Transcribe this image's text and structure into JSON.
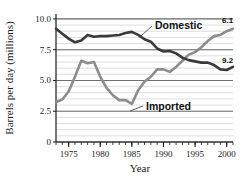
{
  "chart_data": {
    "type": "line",
    "title": "",
    "xlabel": "Year",
    "ylabel": "Barrels per day (millions)",
    "xlim": [
      1973,
      2001
    ],
    "ylim": [
      0,
      10.4
    ],
    "yticks": [
      "0",
      "2.5",
      "5.0",
      "7.5",
      "10.0"
    ],
    "ytick_values": [
      0,
      2.5,
      5.0,
      7.5,
      10.0
    ],
    "xticks": [
      "1975",
      "1980",
      "1985",
      "1990",
      "1995",
      "2000"
    ],
    "xtick_values": [
      1975,
      1980,
      1985,
      1990,
      1995,
      2000
    ],
    "grid": "horizontal-minor-and-major",
    "minor_y_step": 0.5,
    "minor_x_step": 1,
    "legend_position": "inline-annotations",
    "series": [
      {
        "name": "Domestic",
        "label": "Domestic",
        "color": "#3a3a3a",
        "end_value_label": "9.2",
        "x": [
          1973,
          1974,
          1975,
          1976,
          1977,
          1978,
          1979,
          1980,
          1981,
          1982,
          1983,
          1984,
          1985,
          1986,
          1987,
          1988,
          1989,
          1990,
          1991,
          1992,
          1993,
          1994,
          1995,
          1996,
          1997,
          1998,
          1999,
          2000,
          2001
        ],
        "values": [
          9.2,
          8.8,
          8.4,
          8.1,
          8.25,
          8.7,
          8.55,
          8.6,
          8.6,
          8.65,
          8.7,
          8.85,
          8.95,
          8.7,
          8.35,
          8.15,
          7.6,
          7.35,
          7.4,
          7.2,
          6.85,
          6.65,
          6.55,
          6.45,
          6.45,
          6.25,
          5.9,
          5.85,
          6.1
        ]
      },
      {
        "name": "Imported",
        "label": "Imported",
        "color": "#8c8c8c",
        "end_value_label": "6.1",
        "x": [
          1973,
          1974,
          1975,
          1976,
          1977,
          1978,
          1979,
          1980,
          1981,
          1982,
          1983,
          1984,
          1985,
          1986,
          1987,
          1988,
          1989,
          1990,
          1991,
          1992,
          1993,
          1994,
          1995,
          1996,
          1997,
          1998,
          1999,
          2000,
          2001
        ],
        "values": [
          3.25,
          3.45,
          4.1,
          5.3,
          6.6,
          6.4,
          6.5,
          5.3,
          4.4,
          3.8,
          3.4,
          3.4,
          3.1,
          4.2,
          4.9,
          5.3,
          5.9,
          5.9,
          5.7,
          6.1,
          6.6,
          7.1,
          7.3,
          7.7,
          8.2,
          8.6,
          8.7,
          9.0,
          9.2
        ]
      }
    ],
    "annotations": [
      {
        "text": "Domestic",
        "series": "Domestic",
        "kind": "series-callout"
      },
      {
        "text": "Imported",
        "series": "Imported",
        "kind": "series-callout"
      },
      {
        "text": "9.2",
        "kind": "endpoint",
        "series": "Imported"
      },
      {
        "text": "6.1",
        "kind": "endpoint",
        "series": "Domestic"
      }
    ],
    "colors": {
      "domestic": "#3a3a3a",
      "imported": "#8c8c8c",
      "major_grid": "#6f6f6f",
      "minor_grid": "#cfcfcf",
      "axis": "#1a1a1a",
      "background": "#ffffff"
    }
  }
}
